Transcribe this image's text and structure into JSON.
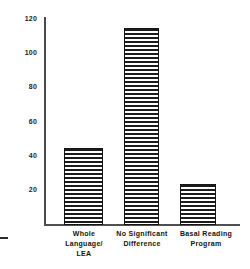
{
  "chart_data": {
    "type": "bar",
    "title": "",
    "subtitle": "",
    "xlabel": "",
    "ylabel": "",
    "categories": [
      "Whole Language/ LEA",
      "No Significant Difference",
      "Basal Reading Program"
    ],
    "category_lines": [
      [
        "Whole",
        "Language/",
        "LEA"
      ],
      [
        "No  Significant",
        "Difference"
      ],
      [
        "Basal  Reading",
        "Program"
      ]
    ],
    "values": [
      45,
      115,
      24
    ],
    "ylim": [
      0,
      120
    ],
    "yticks": [
      120,
      100,
      80,
      60,
      40,
      20
    ],
    "ytick_labels": [
      "120",
      "100",
      "80",
      "60",
      "40",
      "20"
    ],
    "grid": false,
    "legend": false,
    "legend_position": "none",
    "bar_fill": "horizontal-hatch",
    "bar_color": "#1b1b1b",
    "axis_color": "#4a4a4a",
    "background": "#ffffff"
  }
}
